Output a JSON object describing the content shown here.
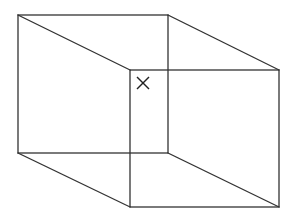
{
  "diagram": {
    "type": "necker-cube-wireframe",
    "background": "#ffffff",
    "line_color": "#333333",
    "back_face": {
      "x1": 18,
      "y1": 15,
      "x2": 168,
      "y2": 153
    },
    "front_face": {
      "x1": 130,
      "y1": 70,
      "x2": 279,
      "y2": 207
    },
    "connectors": [
      {
        "from": [
          18,
          15
        ],
        "to": [
          130,
          70
        ]
      },
      {
        "from": [
          168,
          15
        ],
        "to": [
          279,
          70
        ]
      },
      {
        "from": [
          18,
          153
        ],
        "to": [
          130,
          207
        ]
      },
      {
        "from": [
          168,
          153
        ],
        "to": [
          279,
          207
        ]
      }
    ],
    "marker": {
      "symbol": "x-mark",
      "cx": 143,
      "cy": 83,
      "size": 12
    }
  }
}
